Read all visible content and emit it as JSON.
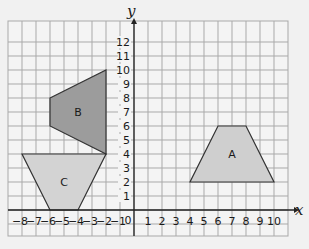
{
  "figure": {
    "type": "coordinate-grid",
    "x_axis": {
      "label": "x",
      "min": -8,
      "max": 10,
      "grid_min": -9,
      "grid_max": 11,
      "ticks": [
        "-8",
        "-7",
        "-6",
        "-5",
        "-4",
        "-3",
        "-2",
        "-1",
        "0",
        "1",
        "2",
        "3",
        "4",
        "5",
        "6",
        "7",
        "8",
        "9",
        "10"
      ]
    },
    "y_axis": {
      "label": "y",
      "min": 0,
      "max": 12,
      "grid_min": -2,
      "grid_max": 13,
      "ticks": [
        "1",
        "2",
        "3",
        "4",
        "5",
        "6",
        "7",
        "8",
        "9",
        "10",
        "11",
        "12"
      ]
    },
    "origin_label": "0",
    "shapes": [
      {
        "label": "A",
        "fill": "#cfcfcf",
        "vertices": [
          [
            4,
            2
          ],
          [
            10,
            2
          ],
          [
            8,
            6
          ],
          [
            6,
            6
          ]
        ]
      },
      {
        "label": "B",
        "fill": "#9c9c9c",
        "vertices": [
          [
            -6,
            8
          ],
          [
            -2,
            10
          ],
          [
            -2,
            4
          ],
          [
            -6,
            6
          ]
        ]
      },
      {
        "label": "C",
        "fill": "#d3d3d3",
        "vertices": [
          [
            -8,
            4
          ],
          [
            -2,
            4
          ],
          [
            -4,
            0
          ],
          [
            -6,
            0
          ]
        ]
      }
    ],
    "colors": {
      "background": "#f1f1f1",
      "grid": "#a9a9a9",
      "axis": "#222222",
      "outline": "#333333"
    }
  }
}
